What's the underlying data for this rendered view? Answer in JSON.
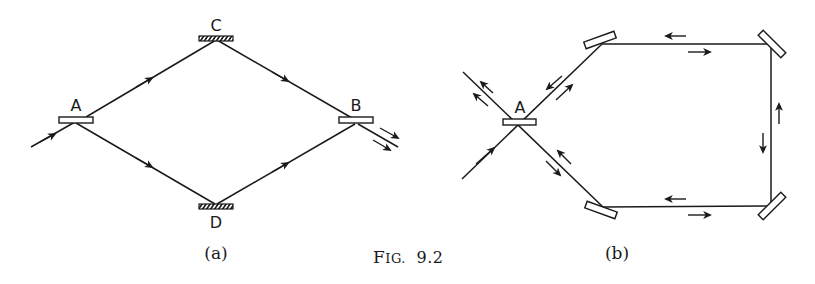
{
  "figure": {
    "caption_prefix": "FIG.",
    "caption_number": "9.2"
  },
  "panel_a": {
    "sublabel": "(a)",
    "type": "Mach-Zehnder interferometer",
    "labels": {
      "A": "A",
      "B": "B",
      "C": "C",
      "D": "D"
    },
    "components": [
      {
        "id": "A",
        "kind": "beam-splitter"
      },
      {
        "id": "C",
        "kind": "mirror (hatched)"
      },
      {
        "id": "D",
        "kind": "mirror (hatched)"
      },
      {
        "id": "B",
        "kind": "beam-splitter"
      }
    ],
    "paths": [
      "input → A",
      "A → C → B",
      "A → D → B",
      "B → two output beams"
    ]
  },
  "panel_b": {
    "sublabel": "(b)",
    "type": "Sagnac ring interferometer",
    "labels": {
      "A": "A"
    },
    "components": [
      {
        "id": "A",
        "kind": "beam-splitter"
      },
      {
        "id": "M1",
        "kind": "mirror (upper-left)"
      },
      {
        "id": "M2",
        "kind": "mirror (upper-right)"
      },
      {
        "id": "M3",
        "kind": "mirror (lower-right)"
      },
      {
        "id": "M4",
        "kind": "mirror (lower-left)"
      }
    ],
    "paths": [
      "input → A",
      "counter-propagating beams around rectangular loop",
      "outputs returning through A"
    ]
  },
  "colors": {
    "ink": "#1a1a1a",
    "paper": "#ffffff"
  }
}
